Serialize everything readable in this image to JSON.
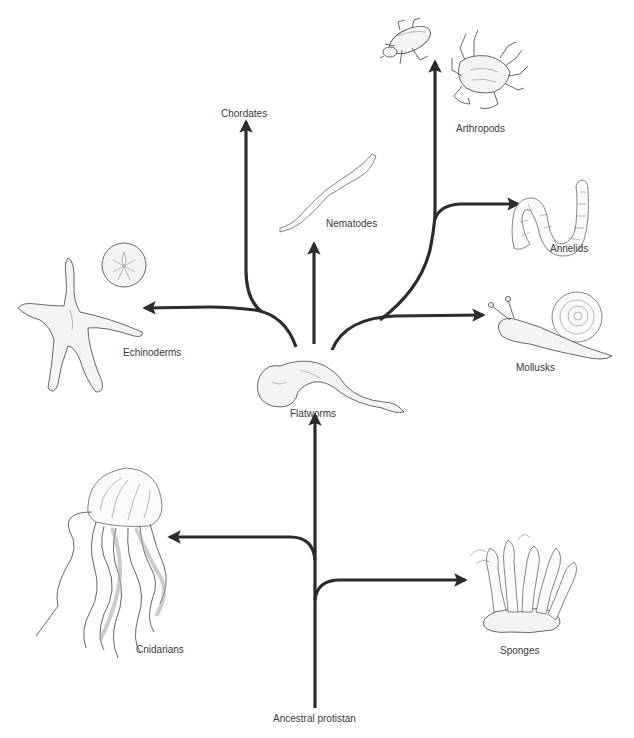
{
  "diagram": {
    "type": "phylogenetic-tree",
    "root": "Ancestral protistan",
    "colors": {
      "branch": "#2b2b2b",
      "label": "#3a3a3a",
      "background": "#ffffff"
    },
    "labels": {
      "ancestral": "Ancestral protistan",
      "sponges": "Sponges",
      "cnidarians": "Cnidarians",
      "flatworms": "Flatworms",
      "echinoderms": "Echinoderms",
      "chordates": "Chordates",
      "nematodes": "Nematodes",
      "arthropods": "Arthropods",
      "annelids": "Annelids",
      "mollusks": "Mollusks"
    },
    "edges": [
      {
        "from": "Ancestral protistan",
        "to": "Sponges"
      },
      {
        "from": "Ancestral protistan",
        "to": "Cnidarians"
      },
      {
        "from": "Ancestral protistan",
        "to": "Flatworms"
      },
      {
        "from": "Flatworms",
        "to": "Echinoderms"
      },
      {
        "from": "Flatworms",
        "to": "Chordates"
      },
      {
        "from": "Flatworms",
        "to": "Nematodes"
      },
      {
        "from": "Flatworms",
        "to": "Mollusks"
      },
      {
        "from": "Flatworms",
        "to": "Annelids"
      },
      {
        "from": "Flatworms",
        "to": "Arthropods"
      }
    ],
    "illustrations": [
      "sponge-illustration",
      "jellyfish-illustration",
      "flatworm-illustration",
      "starfish-illustration",
      "sand-dollar-illustration",
      "nematode-illustration",
      "beetle-illustration",
      "crab-illustration",
      "earthworm-illustration",
      "snail-illustration"
    ]
  }
}
